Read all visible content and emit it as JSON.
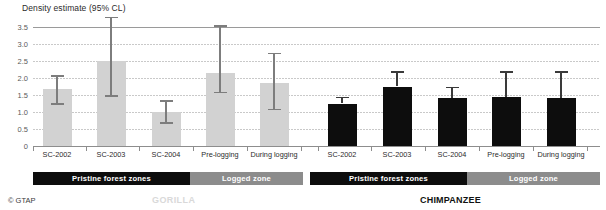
{
  "chart_data": {
    "type": "bar",
    "title": "Density estimate (95% CL)",
    "ylabel": "Density estimate (95% CL)",
    "xlabel": "",
    "ylim": [
      0,
      3.5
    ],
    "yticks": [
      "0",
      "0.5",
      "1.0",
      "1.5",
      "2.0",
      "2.5",
      "3.0",
      "3.5"
    ],
    "ytick_values": [
      0,
      0.5,
      1.0,
      1.5,
      2.0,
      2.5,
      3.0,
      3.5
    ],
    "grid": true,
    "legend": "none",
    "categories": [
      "SC-2002",
      "SC-2003",
      "SC-2004",
      "Pre-logging",
      "During logging",
      "SC-2002",
      "SC-2003",
      "SC-2004",
      "Pre-logging",
      "During logging"
    ],
    "series": [
      {
        "name": "Gorilla",
        "color": "#d2d2d2",
        "values": [
          1.68,
          2.5,
          1.0,
          2.15,
          1.85,
          null,
          null,
          null,
          null,
          null
        ],
        "ci_low": [
          1.26,
          1.5,
          0.7,
          1.6,
          1.1,
          null,
          null,
          null,
          null,
          null
        ],
        "ci_high": [
          2.09,
          3.8,
          1.35,
          3.55,
          2.75,
          null,
          null,
          null,
          null,
          null
        ]
      },
      {
        "name": "Chimpanzee",
        "color": "#0d0d0d",
        "values": [
          null,
          null,
          null,
          null,
          null,
          1.25,
          1.75,
          1.4,
          1.45,
          1.4
        ],
        "ci_low": [
          null,
          null,
          null,
          null,
          null,
          1.25,
          1.75,
          1.4,
          1.45,
          1.4
        ],
        "ci_high": [
          null,
          null,
          null,
          null,
          null,
          1.45,
          2.2,
          1.75,
          2.2,
          2.2
        ]
      }
    ],
    "annotations": [
      {
        "label": "Pristine forest zones",
        "group": "gorilla",
        "span": [
          "SC-2002",
          "SC-2004"
        ]
      },
      {
        "label": "Logged zone",
        "group": "gorilla",
        "span": [
          "Pre-logging",
          "During logging"
        ]
      },
      {
        "label": "Pristine forest zones",
        "group": "chimpanzee",
        "span": [
          "SC-2002",
          "SC-2004"
        ]
      },
      {
        "label": "Logged zone",
        "group": "chimpanzee",
        "span": [
          "Pre-logging",
          "During logging"
        ]
      }
    ]
  },
  "axis": {
    "title": "Density estimate (95% CL)",
    "yticks": [
      "3.5",
      "3.0",
      "2.5",
      "2.0",
      "1.5",
      "1.0",
      "0.5",
      "0"
    ]
  },
  "xlabels": [
    "SC-2002",
    "SC-2003",
    "SC-2004",
    "Pre-logging",
    "During logging",
    "SC-2002",
    "SC-2003",
    "SC-2004",
    "Pre-logging",
    "During logging"
  ],
  "bands": [
    {
      "label": "Pristine forest zones",
      "style": "pristine"
    },
    {
      "label": "Logged zone",
      "style": "logged"
    },
    {
      "label": "Pristine forest zones",
      "style": "pristine"
    },
    {
      "label": "Logged zone",
      "style": "logged"
    }
  ],
  "footer": {
    "copyright": "© GTAP",
    "left_group": "GORILLA",
    "right_group": "CHIMPANZEE"
  },
  "colors": {
    "gorilla_bar": "#d2d2d2",
    "chimpanzee_bar": "#0d0d0d",
    "band_pristine": "#0d0d0d",
    "band_logged": "#8c8c8c"
  }
}
